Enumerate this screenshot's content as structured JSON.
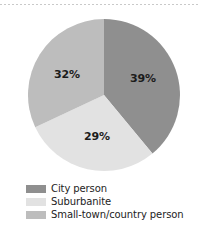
{
  "chart_data": {
    "type": "pie",
    "title": "",
    "subtitle": "",
    "xlabel": "",
    "ylabel": "",
    "grid": false,
    "legend_position": "bottom-left",
    "start_angle_deg": 0,
    "direction": "clockwise",
    "categories": [
      "City person",
      "Suburbanite",
      "Small-town/country person"
    ],
    "values": [
      39,
      29,
      32
    ],
    "value_unit": "%",
    "data_labels": [
      "39%",
      "29%",
      "32%"
    ],
    "colors": [
      "#8f8f8f",
      "#e2e2e2",
      "#bdbdbd"
    ],
    "slices": [
      {
        "label": "City person",
        "value": 39,
        "data_label": "39%",
        "color": "#8f8f8f"
      },
      {
        "label": "Suburbanite",
        "value": 29,
        "data_label": "29%",
        "color": "#e2e2e2"
      },
      {
        "label": "Small-town/country person",
        "value": 32,
        "data_label": "32%",
        "color": "#bdbdbd"
      }
    ]
  },
  "legend": {
    "items": [
      {
        "label": "City person",
        "color": "#8f8f8f"
      },
      {
        "label": "Suburbanite",
        "color": "#e2e2e2"
      },
      {
        "label": "Small-town/country person",
        "color": "#bdbdbd"
      }
    ]
  },
  "decor": {
    "top_rule_color": "#c9c9c9"
  }
}
